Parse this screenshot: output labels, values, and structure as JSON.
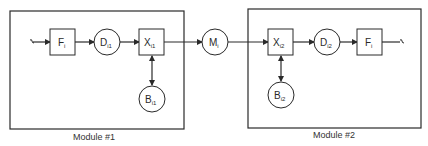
{
  "diagram": {
    "colors": {
      "stroke": "#2a2a2a",
      "background": "#ffffff"
    },
    "modules": [
      {
        "id": "module-1",
        "label": "Module #1"
      },
      {
        "id": "module-2",
        "label": "Module #2"
      }
    ],
    "nodes": {
      "f1": {
        "main": "F",
        "sub": "i",
        "shape": "square"
      },
      "d1": {
        "main": "D",
        "sub": "i1",
        "shape": "circle"
      },
      "x1": {
        "main": "X",
        "sub": "i1",
        "shape": "square"
      },
      "b1": {
        "main": "B",
        "sub": "i1",
        "shape": "circle"
      },
      "m": {
        "main": "M",
        "sub": "i",
        "shape": "circle"
      },
      "x2": {
        "main": "X",
        "sub": "i2",
        "shape": "square"
      },
      "d2": {
        "main": "D",
        "sub": "i2",
        "shape": "circle"
      },
      "b2": {
        "main": "B",
        "sub": "i2",
        "shape": "circle"
      },
      "f2": {
        "main": "F",
        "sub": "i",
        "shape": "square"
      }
    },
    "edges": [
      "input -> F_i (module 1)",
      "F_i -> D_i1",
      "D_i1 -> X_i1",
      "X_i1 <-> B_i1",
      "X_i1 -> M_i",
      "M_i -> X_i2",
      "X_i2 <-> B_i2",
      "X_i2 -> D_i2",
      "D_i2 -> F_i (module 2)",
      "F_i -> output"
    ]
  }
}
